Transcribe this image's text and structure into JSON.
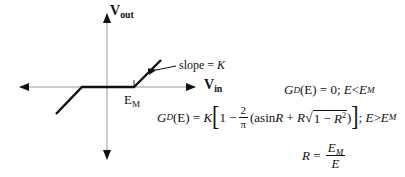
{
  "diagram": {
    "axes": {
      "vertical_label_main": "V",
      "vertical_label_sub": "out",
      "horizontal_label_main": "V",
      "horizontal_label_sub": "in"
    },
    "threshold_label_main": "E",
    "threshold_label_sub": "M",
    "slope_annotation": "slope = ",
    "slope_symbol": "K"
  },
  "equations": {
    "eq1": {
      "lhs_G": "G",
      "lhs_sub": "D",
      "lhs_arg": "(E)",
      "equals": "=",
      "rhs": "0; ",
      "cond_var": "E",
      "cond_op": "<",
      "cond_rhs": "E",
      "cond_rhs_sub": "M"
    },
    "eq2": {
      "lhs_G": "G",
      "lhs_sub": "D",
      "lhs_arg": "(E)",
      "equals": "=",
      "K": "K",
      "open_bracket": "[",
      "one_minus": "1 − ",
      "frac_num": "2",
      "frac_den": "π",
      "paren_open": "(asin",
      "R1": "R",
      "plus": " + ",
      "R2": "R",
      "sqrt_sign": "√",
      "sqrt_body": "1 − ",
      "R3": "R",
      "sq": "2",
      "paren_close": ")",
      "close_bracket": "]",
      "cond_sep": "; ",
      "cond_var": "E",
      "cond_op": ">",
      "cond_rhs": "E",
      "cond_rhs_sub": "M"
    },
    "eq3": {
      "lhs": "R",
      "equals": "=",
      "num": "E",
      "num_sub": "M",
      "den": "E"
    }
  }
}
